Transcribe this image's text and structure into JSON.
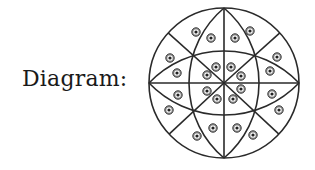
{
  "label": "Diagram:",
  "diagram": {
    "type": "circle-partition-with-dots",
    "stroke_color": "#2a2a2a",
    "dot_color": "#333333",
    "center": [
      224,
      83
    ],
    "radius": 75,
    "horizontal_lens": {
      "sagitta": 32
    },
    "vertical_lens": {
      "sagitta": 35
    },
    "diagonal_directions": [
      [
        -29,
        -26
      ],
      [
        29,
        -26
      ],
      [
        -29,
        27
      ],
      [
        29,
        27
      ]
    ],
    "dots": [
      [
        196,
        32
      ],
      [
        211,
        38
      ],
      [
        235,
        38
      ],
      [
        250,
        31
      ],
      [
        170,
        58
      ],
      [
        277,
        57
      ],
      [
        177,
        73
      ],
      [
        178,
        95
      ],
      [
        270,
        71
      ],
      [
        272,
        94
      ],
      [
        169,
        110
      ],
      [
        279,
        110
      ],
      [
        213,
        128
      ],
      [
        237,
        128
      ],
      [
        197,
        136
      ],
      [
        253,
        135
      ],
      [
        216,
        67
      ],
      [
        231,
        67
      ],
      [
        207,
        75
      ],
      [
        241,
        76
      ],
      [
        207,
        91
      ],
      [
        241,
        89
      ],
      [
        217,
        99
      ],
      [
        233,
        99
      ]
    ]
  }
}
